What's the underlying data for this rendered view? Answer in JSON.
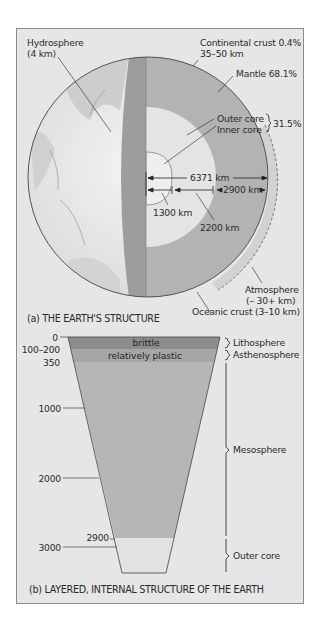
{
  "panel_a": {
    "caption": "(a) THE EARTH'S STRUCTURE",
    "labels": {
      "hydrosphere": "Hydrosphere",
      "hydrosphere_depth": "(4 km)",
      "continental_crust": "Continental crust 0.4%",
      "continental_crust_depth": "35–50 km",
      "mantle": "Mantle 68.1%",
      "outer_core": "Outer core",
      "inner_core": "Inner core",
      "core_percent": "31.5%",
      "radius": "6371 km",
      "mantle_thickness": "2900 km",
      "inner_core_radius": "1300 km",
      "outer_core_thickness": "2200 km",
      "atmosphere": "Atmosphere",
      "atmosphere_depth": "(– 30+ km)",
      "oceanic_crust": "Oceanic crust (3–10 km)"
    }
  },
  "panel_b": {
    "caption": "(b) LAYERED, INTERNAL STRUCTURE OF THE EARTH",
    "bands": {
      "brittle": "brittle",
      "plastic": "relatively plastic"
    },
    "depth_ticks": [
      "0",
      "100–200",
      "350",
      "1000",
      "2000",
      "2900",
      "3000"
    ],
    "layers": [
      "Lithosphere",
      "Asthenosphere",
      "Mesosphere",
      "Outer core"
    ]
  },
  "colors": {
    "background": "#e6e6e6",
    "brittle": "#8c8c8c",
    "plastic": "#a6a6a6",
    "mantle": "#b5b5b5",
    "outer_core": "#e0e0e0",
    "crust_band": "#9d9d9d",
    "atmosphere": "#d2d2d2"
  }
}
